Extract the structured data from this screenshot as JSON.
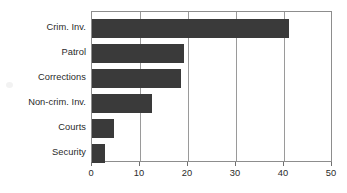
{
  "chart_data": {
    "type": "bar",
    "orientation": "horizontal",
    "title": "",
    "xlabel": "",
    "ylabel": "",
    "categories": [
      "Crim. Inv.",
      "Patrol",
      "Corrections",
      "Non-crim. Inv.",
      "Courts",
      "Security"
    ],
    "values": [
      41,
      19.2,
      18.6,
      12.5,
      4.6,
      2.7
    ],
    "series": [
      {
        "name": "",
        "values": [
          41,
          19.2,
          18.6,
          12.5,
          4.6,
          2.7
        ]
      }
    ],
    "xlim": [
      0,
      50
    ],
    "xticks": [
      0,
      10,
      20,
      30,
      40,
      50
    ],
    "xtick_labels": [
      "0",
      "10",
      "20",
      "30",
      "40",
      "50"
    ],
    "grid": "vertical",
    "legend": "none",
    "bar_color": "#3a3a3a",
    "axis_color": "#8d8d8d",
    "gridline_color": "#9a9a9a",
    "background_color": "#ffffff"
  }
}
